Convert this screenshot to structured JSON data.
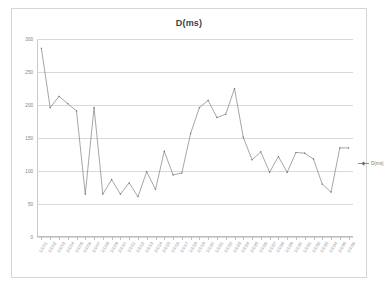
{
  "chart_data": {
    "type": "line",
    "title": "D(ms)",
    "xlabel": "",
    "ylabel": "",
    "ylim": [
      0,
      300
    ],
    "yticks": [
      0,
      50,
      100,
      150,
      200,
      250,
      300
    ],
    "grid": true,
    "legend_position": "right",
    "series": [
      {
        "name": "D(ms)",
        "marker": "diamond",
        "color": "#808080",
        "values": [
          286,
          196,
          213,
          202,
          191,
          65,
          196,
          65,
          87,
          65,
          82,
          61,
          99,
          72,
          130,
          94,
          97,
          157,
          196,
          207,
          181,
          186,
          225,
          151,
          117,
          129,
          98,
          122,
          98,
          128,
          127,
          118,
          80,
          68,
          135,
          135
        ]
      }
    ],
    "categories": [
      "1/1/01",
      "1/1/02",
      "1/1/03",
      "1/1/04",
      "1/1/05",
      "1/1/06",
      "1/1/07",
      "1/1/08",
      "1/1/09",
      "1/1/10",
      "1/1/11",
      "1/1/12",
      "1/1/13",
      "1/1/14",
      "1/1/15",
      "1/1/16",
      "1/1/17",
      "1/1/18",
      "1/1/19",
      "1/1/20",
      "1/1/21",
      "1/1/22",
      "1/1/23",
      "1/1/24",
      "1/1/25",
      "1/1/26",
      "1/1/27",
      "1/1/28",
      "1/1/29",
      "1/1/30",
      "1/1/31",
      "1/1/32",
      "1/1/33",
      "1/1/34",
      "1/1/35",
      "1/1/36"
    ]
  },
  "legend": {
    "entry_label": "D(ms)"
  },
  "colors": {
    "line": "#808080",
    "marker": "#6f6f6f",
    "grid": "#d9d9d9",
    "border": "#d6d6d6",
    "text": "#808080",
    "title": "#3f3f3f",
    "background": "#ffffff"
  }
}
